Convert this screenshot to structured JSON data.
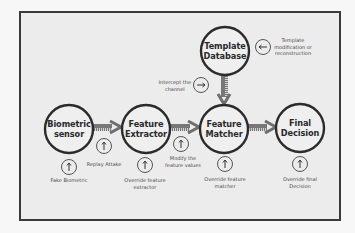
{
  "diagram": {
    "type": "biometric-system-attack-points",
    "colors": {
      "node_stroke": "#2b2b2b",
      "arrow_fill": "#6e6e6e",
      "frame_border": "#3a3a3a",
      "background": "#ececec",
      "text": "#2a2a2a",
      "attack_text": "#4a4a4a"
    },
    "nodes": [
      {
        "id": "biometric-sensor",
        "line1": "Biometric",
        "line2": "sensor",
        "cx": 69,
        "cy": 129
      },
      {
        "id": "feature-extractor",
        "line1": "Feature",
        "line2": "Extractor",
        "cx": 146,
        "cy": 129
      },
      {
        "id": "feature-matcher",
        "line1": "Feature",
        "line2": "Matcher",
        "cx": 224,
        "cy": 129
      },
      {
        "id": "final-decision",
        "line1": "Final",
        "line2": "Decision",
        "cx": 300,
        "cy": 128
      },
      {
        "id": "template-database",
        "line1": "Template",
        "line2": "Database",
        "cx": 225,
        "cy": 51
      }
    ],
    "edges": [
      {
        "from": "biometric-sensor",
        "to": "feature-extractor",
        "direction": "right"
      },
      {
        "from": "feature-extractor",
        "to": "feature-matcher",
        "direction": "right"
      },
      {
        "from": "feature-matcher",
        "to": "final-decision",
        "direction": "right"
      },
      {
        "from": "template-database",
        "to": "feature-matcher",
        "direction": "down"
      }
    ],
    "attacks": [
      {
        "id": "fake-biometric",
        "icon": "up-arrow-icon",
        "line1": "Fake Biometric",
        "line2": ""
      },
      {
        "id": "replay-attack",
        "icon": "up-arrow-icon",
        "line1": "Replay Attake",
        "line2": ""
      },
      {
        "id": "override-feature-extractor",
        "icon": "up-arrow-icon",
        "line1": "Override feature",
        "line2": "extractor"
      },
      {
        "id": "modify-feature-values",
        "icon": "up-arrow-icon",
        "line1": "Modify the",
        "line2": "feature values"
      },
      {
        "id": "override-feature-matcher",
        "icon": "up-arrow-icon",
        "line1": "Override feature",
        "line2": "matcher"
      },
      {
        "id": "override-final-decision",
        "icon": "up-arrow-icon",
        "line1": "Override final",
        "line2": "Decision"
      },
      {
        "id": "intercept-channel",
        "icon": "right-arrow-icon",
        "line1": "Intercept the",
        "line2": "channel"
      },
      {
        "id": "template-modification",
        "icon": "left-arrow-icon",
        "line1": "Template",
        "line2": "modification or",
        "line3": "reconstruction"
      }
    ]
  }
}
